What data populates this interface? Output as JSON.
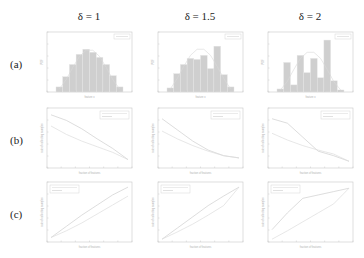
{
  "figure": {
    "columns": [
      {
        "label": "δ = 1",
        "sym": "δ",
        "val": "= 1"
      },
      {
        "label": "δ = 1.5",
        "sym": "δ",
        "val": "= 1.5"
      },
      {
        "label": "δ = 2",
        "sym": "δ",
        "val": "= 2"
      }
    ],
    "rows": [
      "(a)",
      "(b)",
      "(c)"
    ]
  },
  "chart_data": [
    {
      "type": "bar",
      "row": "(a)",
      "column": "δ = 1",
      "title": "",
      "xlabel": "feature x",
      "ylabel": "PDF",
      "categories": [
        "1",
        "2",
        "3",
        "4",
        "5",
        "6",
        "7",
        "8",
        "9",
        "10"
      ],
      "values": [
        0.5,
        1.5,
        2.7,
        3.7,
        4.2,
        3.9,
        3.4,
        2.7,
        1.6,
        0.5
      ],
      "overlay_line": [
        0.3,
        1.2,
        2.4,
        3.5,
        4.1,
        4.1,
        3.5,
        2.4,
        1.2,
        0.3
      ],
      "legend": [
        "fit"
      ]
    },
    {
      "type": "bar",
      "row": "(a)",
      "column": "δ = 1.5",
      "title": "",
      "xlabel": "feature x",
      "ylabel": "PDF",
      "categories": [
        "1",
        "2",
        "3",
        "4",
        "5",
        "6",
        "7",
        "8",
        "9",
        "10"
      ],
      "values": [
        0.4,
        1.8,
        2.7,
        3.3,
        3.2,
        3.6,
        2.3,
        4.5,
        1.7,
        0.5
      ],
      "overlay_line": [
        0.3,
        1.3,
        2.5,
        3.6,
        4.2,
        4.2,
        3.6,
        2.5,
        1.3,
        0.3
      ],
      "legend": [
        "fit"
      ]
    },
    {
      "type": "bar",
      "row": "(a)",
      "column": "δ = 2",
      "title": "",
      "xlabel": "feature x",
      "ylabel": "PDF",
      "categories": [
        "1",
        "2",
        "3",
        "4",
        "5",
        "6",
        "7",
        "8",
        "9",
        "10"
      ],
      "values": [
        0.3,
        2.9,
        0.7,
        3.6,
        1.9,
        3.3,
        1.4,
        5.1,
        1.1,
        0.2
      ],
      "overlay_line": [
        0.2,
        1.0,
        2.2,
        3.3,
        3.9,
        3.9,
        3.3,
        2.2,
        1.0,
        0.2
      ],
      "legend": [
        "fit"
      ]
    },
    {
      "type": "line",
      "row": "(b)",
      "column": "δ = 1",
      "xlabel": "fraction of features",
      "ylabel": "rate of collecting samples",
      "x": [
        0,
        0.2,
        0.4,
        0.6,
        0.8,
        1.0
      ],
      "series": [
        {
          "name": "upper curve",
          "values": [
            0.95,
            0.85,
            0.7,
            0.52,
            0.35,
            0.15
          ]
        },
        {
          "name": "lower curve",
          "values": [
            0.75,
            0.6,
            0.48,
            0.38,
            0.28,
            0.15
          ]
        }
      ],
      "ylim": [
        0,
        1
      ]
    },
    {
      "type": "line",
      "row": "(b)",
      "column": "δ = 1.5",
      "xlabel": "fraction of features",
      "ylabel": "rate of collecting samples",
      "x": [
        0,
        0.2,
        0.4,
        0.6,
        0.8,
        1.0
      ],
      "series": [
        {
          "name": "upper curve",
          "values": [
            0.88,
            0.68,
            0.48,
            0.32,
            0.22,
            0.18
          ]
        },
        {
          "name": "lower curve",
          "values": [
            0.66,
            0.52,
            0.4,
            0.3,
            0.22,
            0.18
          ]
        }
      ],
      "ylim": [
        0,
        1
      ]
    },
    {
      "type": "line",
      "row": "(b)",
      "column": "δ = 2",
      "xlabel": "fraction of features",
      "ylabel": "rate of collecting samples",
      "x": [
        0,
        0.2,
        0.4,
        0.6,
        0.8,
        1.0
      ],
      "series": [
        {
          "name": "upper curve",
          "values": [
            0.88,
            0.8,
            0.55,
            0.3,
            0.22,
            0.12
          ]
        },
        {
          "name": "lower curve",
          "values": [
            0.62,
            0.5,
            0.4,
            0.32,
            0.25,
            0.12
          ]
        }
      ],
      "ylim": [
        0,
        1
      ]
    },
    {
      "type": "line",
      "row": "(c)",
      "column": "δ = 1",
      "xlabel": "fraction of features",
      "ylabel": "rate of collecting samples",
      "x": [
        0,
        0.2,
        0.4,
        0.6,
        0.8,
        1.0
      ],
      "series": [
        {
          "name": "upper curve",
          "values": [
            0.08,
            0.28,
            0.48,
            0.66,
            0.84,
            0.98
          ]
        },
        {
          "name": "lower curve",
          "values": [
            0.08,
            0.2,
            0.34,
            0.5,
            0.66,
            0.82
          ]
        }
      ],
      "ylim": [
        0,
        1
      ]
    },
    {
      "type": "line",
      "row": "(c)",
      "column": "δ = 1.5",
      "xlabel": "fraction of features",
      "ylabel": "rate of collecting samples",
      "x": [
        0,
        0.2,
        0.4,
        0.6,
        0.8,
        1.0
      ],
      "series": [
        {
          "name": "upper curve",
          "values": [
            0.05,
            0.25,
            0.45,
            0.65,
            0.82,
            0.98
          ]
        },
        {
          "name": "lower curve",
          "values": [
            0.05,
            0.18,
            0.32,
            0.48,
            0.65,
            0.98
          ]
        }
      ],
      "ylim": [
        0,
        1
      ]
    },
    {
      "type": "line",
      "row": "(c)",
      "column": "δ = 2",
      "xlabel": "fraction of features",
      "ylabel": "rate of collecting samples",
      "x": [
        0,
        0.2,
        0.4,
        0.6,
        0.8,
        1.0
      ],
      "series": [
        {
          "name": "upper curve",
          "values": [
            0.22,
            0.52,
            0.78,
            0.84,
            0.9,
            0.96
          ]
        },
        {
          "name": "lower curve",
          "values": [
            0.05,
            0.2,
            0.36,
            0.52,
            0.68,
            0.96
          ]
        }
      ],
      "ylim": [
        0,
        1
      ]
    }
  ]
}
